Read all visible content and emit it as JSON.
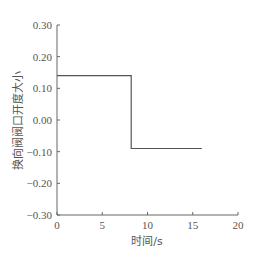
{
  "chart_data": {
    "type": "line",
    "title": "",
    "xlabel": "时间/s",
    "ylabel": "换向阀阀口开度大小",
    "xlim": [
      0,
      20
    ],
    "ylim": [
      -0.3,
      0.3
    ],
    "xticks": [
      0,
      5,
      10,
      15,
      20
    ],
    "xtick_labels": [
      "0",
      "5",
      "10",
      "15",
      "20"
    ],
    "yticks": [
      0.3,
      0.2,
      0.1,
      0.0,
      -0.1,
      -0.2,
      -0.3
    ],
    "ytick_labels": [
      "0.30",
      "0.20",
      "0.10",
      "0.00",
      "−0.10",
      "−0.20",
      "−0.30"
    ],
    "grid": false,
    "legend": null,
    "series": [
      {
        "name": "valve opening",
        "color": "#555555",
        "x": [
          0,
          8.2,
          8.2,
          16
        ],
        "y": [
          0.14,
          0.14,
          -0.09,
          -0.09
        ]
      }
    ]
  }
}
